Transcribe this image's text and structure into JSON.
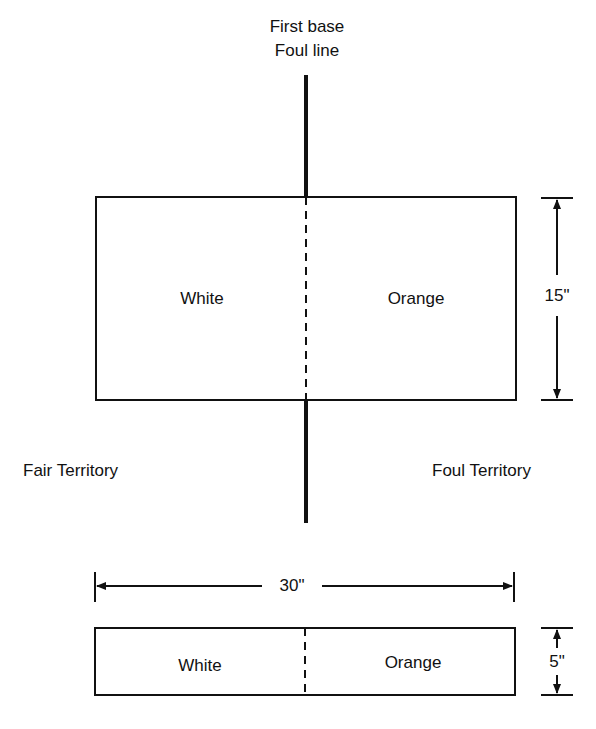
{
  "title": {
    "line1": "First base",
    "line2": "Foul line"
  },
  "large_bag": {
    "left_label": "White",
    "right_label": "Orange",
    "height_dim": "15\""
  },
  "territories": {
    "fair": "Fair Territory",
    "foul": "Foul Territory"
  },
  "width_dim": "30\"",
  "small_bag": {
    "left_label": "White",
    "right_label": "Orange",
    "height_dim": "5\""
  },
  "colors": {
    "line": "#111111",
    "background": "#ffffff"
  }
}
